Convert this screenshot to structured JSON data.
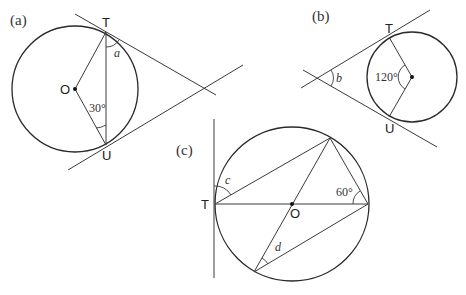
{
  "diagrams": {
    "a": {
      "tag": "(a)",
      "labels": {
        "top": "T",
        "center": "O",
        "bottom": "U"
      },
      "given_angle": "30°",
      "unknown": "a"
    },
    "b": {
      "tag": "(b)",
      "labels": {
        "top": "T",
        "bottom": "U"
      },
      "given_angle": "120°",
      "unknown": "b"
    },
    "c": {
      "tag": "(c)",
      "labels": {
        "left": "T",
        "center": "O"
      },
      "given_angle": "60°",
      "unknown_1": "c",
      "unknown_2": "d"
    }
  },
  "colors": {
    "stroke": "#2a2a2a",
    "text": "#222222",
    "background": "#ffffff"
  }
}
